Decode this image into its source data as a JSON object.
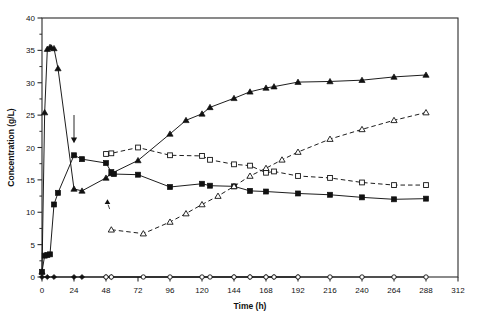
{
  "chart_data": {
    "type": "line",
    "title": "",
    "subtitle": "",
    "xlabel": "Time (h)",
    "ylabel": "Concentration (g/L)",
    "xlim": [
      0,
      312
    ],
    "ylim": [
      0,
      40
    ],
    "xticks": [
      0,
      24,
      48,
      72,
      96,
      120,
      144,
      168,
      192,
      216,
      240,
      264,
      288,
      312
    ],
    "yticks": [
      0,
      5,
      10,
      15,
      20,
      25,
      30,
      35,
      40
    ],
    "xtick_labels": [
      "0",
      "24",
      "48",
      "72",
      "96",
      "120",
      "144",
      "168",
      "192",
      "216",
      "240",
      "264",
      "288",
      "312"
    ],
    "ytick_labels": [
      "0",
      "5",
      "10",
      "15",
      "20",
      "25",
      "30",
      "35",
      "40"
    ],
    "yminor_step": 2.5,
    "grid": false,
    "legend": "none",
    "frame": "box",
    "series": [
      {
        "name": "filled-triangle",
        "marker": "triangle-up-filled",
        "line": "solid",
        "color": "#111111",
        "points": [
          [
            0,
            0.8
          ],
          [
            2,
            25.4
          ],
          [
            4,
            35.2
          ],
          [
            6,
            35.5
          ],
          [
            7,
            35.4
          ],
          [
            9,
            35.3
          ],
          [
            12,
            32.2
          ],
          [
            24,
            13.6
          ],
          [
            30,
            13.3
          ],
          [
            48,
            15.3
          ],
          [
            52,
            16.0
          ],
          [
            72,
            18.0
          ],
          [
            96,
            22.1
          ],
          [
            108,
            24.2
          ],
          [
            120,
            25.2
          ],
          [
            126,
            26.2
          ],
          [
            144,
            27.6
          ],
          [
            156,
            28.6
          ],
          [
            168,
            29.2
          ],
          [
            174,
            29.4
          ],
          [
            192,
            30.1
          ],
          [
            216,
            30.2
          ],
          [
            240,
            30.4
          ],
          [
            264,
            30.9
          ],
          [
            288,
            31.2
          ]
        ]
      },
      {
        "name": "filled-square",
        "marker": "square-filled",
        "line": "solid",
        "color": "#111111",
        "points": [
          [
            0,
            0.8
          ],
          [
            2,
            3.3
          ],
          [
            4,
            3.4
          ],
          [
            6,
            3.5
          ],
          [
            9,
            11.2
          ],
          [
            12,
            13.0
          ],
          [
            24,
            18.8
          ],
          [
            30,
            18.2
          ],
          [
            48,
            17.6
          ],
          [
            52,
            16.2
          ],
          [
            54,
            15.9
          ],
          [
            72,
            15.8
          ],
          [
            96,
            13.9
          ],
          [
            120,
            14.4
          ],
          [
            126,
            14.1
          ],
          [
            144,
            14.0
          ],
          [
            156,
            13.3
          ],
          [
            168,
            13.2
          ],
          [
            192,
            12.9
          ],
          [
            216,
            12.7
          ],
          [
            240,
            12.3
          ],
          [
            264,
            12.0
          ],
          [
            288,
            12.1
          ]
        ]
      },
      {
        "name": "open-square",
        "marker": "square-open",
        "line": "dashed",
        "color": "#111111",
        "points": [
          [
            48,
            19.0
          ],
          [
            52,
            19.1
          ],
          [
            72,
            20.0
          ],
          [
            96,
            18.8
          ],
          [
            120,
            18.7
          ],
          [
            126,
            18.1
          ],
          [
            144,
            17.4
          ],
          [
            156,
            17.2
          ],
          [
            168,
            16.1
          ],
          [
            174,
            16.3
          ],
          [
            192,
            15.6
          ],
          [
            216,
            15.3
          ],
          [
            240,
            14.6
          ],
          [
            264,
            14.2
          ],
          [
            288,
            14.2
          ]
        ]
      },
      {
        "name": "open-triangle",
        "marker": "triangle-up-open",
        "line": "dashed",
        "color": "#111111",
        "points": [
          [
            52,
            7.3
          ],
          [
            76,
            6.7
          ],
          [
            96,
            8.5
          ],
          [
            108,
            9.8
          ],
          [
            120,
            11.2
          ],
          [
            132,
            12.5
          ],
          [
            144,
            14.0
          ],
          [
            156,
            15.6
          ],
          [
            168,
            16.8
          ],
          [
            180,
            18.1
          ],
          [
            192,
            19.3
          ],
          [
            216,
            21.3
          ],
          [
            240,
            22.8
          ],
          [
            264,
            24.2
          ],
          [
            288,
            25.4
          ]
        ]
      },
      {
        "name": "baseline-filled-diamond",
        "marker": "diamond-filled",
        "line": "solid",
        "color": "#111111",
        "points": [
          [
            0,
            0
          ],
          [
            4,
            0
          ],
          [
            9,
            0
          ],
          [
            24,
            0
          ],
          [
            30,
            0
          ],
          [
            48,
            0
          ],
          [
            52,
            0
          ],
          [
            144,
            0
          ],
          [
            156,
            0
          ],
          [
            168,
            0
          ],
          [
            174,
            0
          ],
          [
            192,
            0
          ]
        ]
      },
      {
        "name": "baseline-open-circle",
        "marker": "circle-open",
        "line": "solid",
        "color": "#111111",
        "points": [
          [
            48,
            0
          ],
          [
            52,
            0
          ],
          [
            76,
            0
          ],
          [
            96,
            0
          ],
          [
            120,
            0
          ],
          [
            126,
            0
          ],
          [
            144,
            0
          ],
          [
            156,
            0
          ],
          [
            168,
            0
          ],
          [
            174,
            0
          ],
          [
            192,
            0
          ],
          [
            216,
            0
          ],
          [
            240,
            0
          ],
          [
            264,
            0
          ],
          [
            288,
            0
          ]
        ]
      }
    ],
    "annotations": [
      {
        "name": "downward-arrow-marker",
        "x": 24,
        "y": 21.0,
        "label": ""
      },
      {
        "name": "leader-line-open-triangle",
        "x": 50,
        "y": 10.4,
        "label": ""
      }
    ]
  }
}
